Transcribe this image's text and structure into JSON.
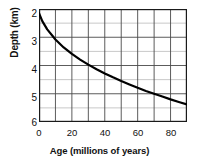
{
  "chart_data": {
    "type": "line",
    "title": "",
    "subtitle": "",
    "xlabel": "Age (millions of years)",
    "ylabel": "Depth (km)",
    "xlim": [
      0,
      90
    ],
    "ylim": [
      6,
      2
    ],
    "y_axis_inverted": true,
    "grid": true,
    "grid_x_step": 10,
    "grid_y_step": 0.5,
    "legend": null,
    "x_ticklabels": [
      "0",
      "20",
      "40",
      "60",
      "80"
    ],
    "x_tickvalues": [
      0,
      20,
      40,
      60,
      80
    ],
    "x_minor_tickvalues": [
      10,
      30,
      50,
      70,
      90
    ],
    "y_ticklabels": [
      "2",
      "3",
      "4",
      "5",
      "6"
    ],
    "y_tickvalues": [
      2,
      3,
      4,
      5,
      6
    ],
    "y_minor_tickvalues": [
      2.5,
      3.5,
      4.5,
      5.5
    ],
    "series": [
      {
        "name": "Ocean floor depth",
        "color": "#000000",
        "linewidth": 2.2,
        "x": [
          0,
          2,
          5,
          10,
          15,
          20,
          25,
          30,
          35,
          40,
          45,
          50,
          55,
          60,
          65,
          70,
          75,
          80,
          85,
          90
        ],
        "y": [
          2.15,
          2.43,
          2.72,
          3.08,
          3.36,
          3.59,
          3.79,
          3.97,
          4.13,
          4.28,
          4.42,
          4.55,
          4.67,
          4.79,
          4.9,
          5.0,
          5.1,
          5.2,
          5.29,
          5.38
        ]
      }
    ],
    "annotations": []
  },
  "axes": {
    "x_title": "Age (millions of years)",
    "y_title": "Depth (km)"
  },
  "colors": {
    "curve": "#000000",
    "major_grid": "#4a4a4a",
    "minor_grid": "#c8c8c8",
    "frame": "#1a1a1a",
    "text": "#111111",
    "background": "#ffffff"
  }
}
